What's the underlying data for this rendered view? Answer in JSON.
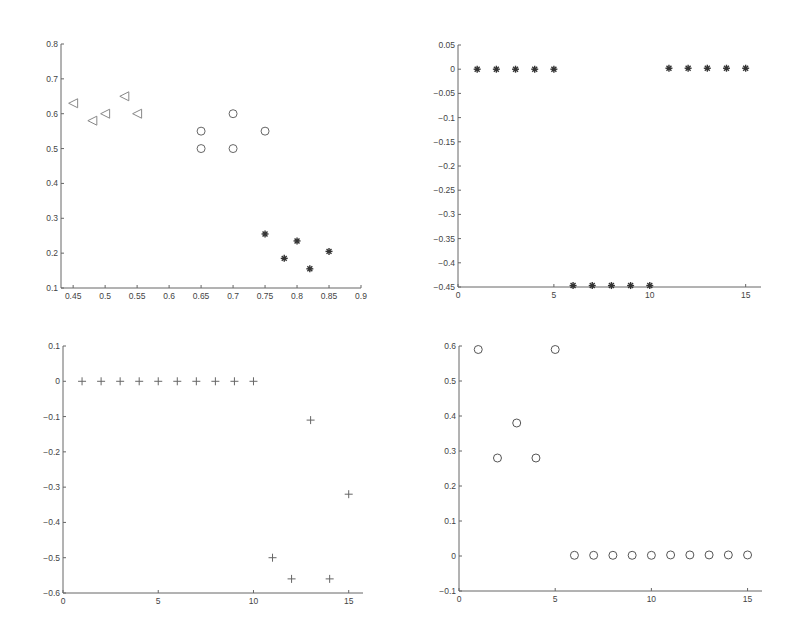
{
  "figure": {
    "width": 794,
    "height": 634,
    "background": "#ffffff",
    "axis_color": "#666666",
    "text_color": "#444444"
  },
  "chart_data": [
    {
      "id": "top-left",
      "type": "scatter",
      "title": "",
      "xlabel": "",
      "ylabel": "",
      "xlim": [
        0.431,
        0.9
      ],
      "ylim": [
        0.1,
        0.8
      ],
      "grid": false,
      "legend": null,
      "xticks": [
        0.45,
        0.5,
        0.55,
        0.6,
        0.65,
        0.7,
        0.75,
        0.8,
        0.85,
        0.9
      ],
      "xtick_labels": [
        "0.45",
        "0.5",
        "0.55",
        "0.6",
        "0.65",
        "0.7",
        "0.75",
        "0.8",
        "0.85",
        "0.9"
      ],
      "yticks": [
        0.1,
        0.2,
        0.3,
        0.4,
        0.5,
        0.6,
        0.7,
        0.8
      ],
      "ytick_labels": [
        "0.1",
        "0.2",
        "0.3",
        "0.4",
        "0.5",
        "0.6",
        "0.7",
        "0.8"
      ],
      "box": {
        "left": 61,
        "top": 44,
        "right": 361,
        "bottom": 288
      },
      "series": [
        {
          "name": "cluster-1",
          "marker": "triangle-left",
          "color": "#888888",
          "x": [
            0.45,
            0.48,
            0.5,
            0.53,
            0.55
          ],
          "y": [
            0.63,
            0.58,
            0.6,
            0.65,
            0.6
          ]
        },
        {
          "name": "cluster-2",
          "marker": "circle",
          "color": "#666666",
          "x": [
            0.65,
            0.65,
            0.7,
            0.7,
            0.75
          ],
          "y": [
            0.55,
            0.5,
            0.6,
            0.5,
            0.55
          ]
        },
        {
          "name": "cluster-3",
          "marker": "star",
          "color": "#333333",
          "x": [
            0.75,
            0.78,
            0.8,
            0.82,
            0.85
          ],
          "y": [
            0.255,
            0.185,
            0.235,
            0.155,
            0.205
          ]
        }
      ]
    },
    {
      "id": "top-right",
      "type": "scatter",
      "title": "",
      "xlabel": "",
      "ylabel": "",
      "xlim": [
        0,
        15.8
      ],
      "ylim": [
        -0.45,
        0.05
      ],
      "grid": false,
      "legend": null,
      "xticks": [
        0,
        5,
        10,
        15
      ],
      "xtick_labels": [
        "0",
        "5",
        "10",
        "15"
      ],
      "yticks": [
        -0.45,
        -0.4,
        -0.35,
        -0.3,
        -0.25,
        -0.2,
        -0.15,
        -0.1,
        -0.05,
        0,
        0.05
      ],
      "ytick_labels": [
        "-0.45",
        "-0.4",
        "-0.35",
        "-0.3",
        "-0.25",
        "-0.2",
        "-0.15",
        "-0.1",
        "-0.05",
        "0",
        "0.05"
      ],
      "box": {
        "left": 458,
        "top": 45,
        "right": 761,
        "bottom": 287
      },
      "series": [
        {
          "name": "values",
          "marker": "star",
          "color": "#333333",
          "x": [
            1,
            2,
            3,
            4,
            5,
            6,
            7,
            8,
            9,
            10,
            11,
            12,
            13,
            14,
            15
          ],
          "y": [
            0,
            0,
            0,
            0,
            0,
            -0.447,
            -0.447,
            -0.447,
            -0.447,
            -0.447,
            0.002,
            0.002,
            0.002,
            0.002,
            0.002
          ]
        }
      ]
    },
    {
      "id": "bottom-left",
      "type": "scatter",
      "title": "",
      "xlabel": "",
      "ylabel": "",
      "xlim": [
        0,
        15.75
      ],
      "ylim": [
        -0.6,
        0.1
      ],
      "grid": false,
      "legend": null,
      "xticks": [
        0,
        5,
        10,
        15
      ],
      "xtick_labels": [
        "0",
        "5",
        "10",
        "15"
      ],
      "yticks": [
        -0.6,
        -0.5,
        -0.4,
        -0.3,
        -0.2,
        -0.1,
        0,
        0.1
      ],
      "ytick_labels": [
        "-0.6",
        "-0.5",
        "-0.4",
        "-0.3",
        "-0.2",
        "-0.1",
        "0",
        "0.1"
      ],
      "box": {
        "left": 63,
        "top": 346,
        "right": 363,
        "bottom": 593
      },
      "series": [
        {
          "name": "values",
          "marker": "plus",
          "color": "#666666",
          "x": [
            1,
            2,
            3,
            4,
            5,
            6,
            7,
            8,
            9,
            10,
            11,
            12,
            13,
            14,
            15
          ],
          "y": [
            0,
            0,
            0,
            0,
            0,
            0,
            0,
            0,
            0,
            0,
            -0.5,
            -0.56,
            -0.11,
            -0.56,
            -0.32
          ]
        }
      ]
    },
    {
      "id": "bottom-right",
      "type": "scatter",
      "title": "",
      "xlabel": "",
      "ylabel": "",
      "xlim": [
        0,
        15.75
      ],
      "ylim": [
        -0.1,
        0.6
      ],
      "grid": false,
      "legend": null,
      "xticks": [
        0,
        5,
        10,
        15
      ],
      "xtick_labels": [
        "0",
        "5",
        "10",
        "15"
      ],
      "yticks": [
        -0.1,
        0,
        0.1,
        0.2,
        0.3,
        0.4,
        0.5,
        0.6
      ],
      "ytick_labels": [
        "-0.1",
        "0",
        "0.1",
        "0.2",
        "0.3",
        "0.4",
        "0.5",
        "0.6"
      ],
      "box": {
        "left": 459,
        "top": 346,
        "right": 762,
        "bottom": 591
      },
      "series": [
        {
          "name": "values",
          "marker": "circle",
          "color": "#555555",
          "x": [
            1,
            2,
            3,
            4,
            5,
            6,
            7,
            8,
            9,
            10,
            11,
            12,
            13,
            14,
            15
          ],
          "y": [
            0.59,
            0.28,
            0.38,
            0.28,
            0.59,
            0.002,
            0.002,
            0.002,
            0.002,
            0.002,
            0.003,
            0.003,
            0.003,
            0.003,
            0.003
          ]
        }
      ]
    }
  ]
}
